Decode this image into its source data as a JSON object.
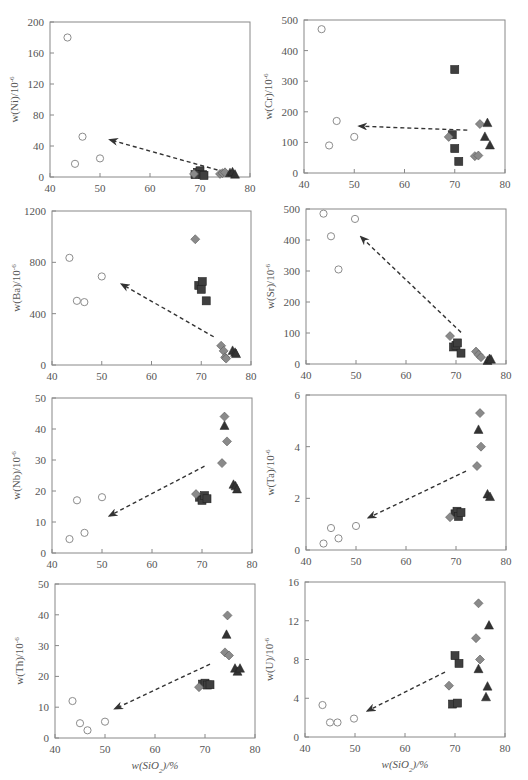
{
  "figure": {
    "x_axis_label": "w(SiO2)/%",
    "x_ticks": [
      40,
      50,
      60,
      70,
      80
    ],
    "xlim": [
      40,
      80
    ],
    "colors": {
      "circle_stroke": "#8c8c8c",
      "circle_fill": "#ffffff",
      "diamond_fill": "#8a8a8a",
      "diamond_stroke": "#5a5a5a",
      "square_fill": "#3f3f3f",
      "triangle_fill": "#333333",
      "axis": "#888888",
      "arrow": "#333333"
    }
  },
  "chart_data": [
    {
      "id": "Ni",
      "type": "scatter",
      "ylabel": "w(Ni)/10^-6",
      "xlabel": "",
      "xlim": [
        40,
        80
      ],
      "ylim": [
        0,
        200
      ],
      "yticks": [
        0,
        40,
        80,
        120,
        160,
        200
      ],
      "series": [
        {
          "name": "circle",
          "points": [
            [
              43.5,
              180
            ],
            [
              45,
              17
            ],
            [
              46.5,
              52
            ],
            [
              50,
              24
            ]
          ]
        },
        {
          "name": "square",
          "points": [
            [
              69.5,
              6
            ],
            [
              70,
              8
            ],
            [
              70.5,
              3
            ],
            [
              69,
              3
            ],
            [
              70.8,
              2
            ]
          ]
        },
        {
          "name": "diamond",
          "points": [
            [
              68.8,
              4
            ],
            [
              74,
              4
            ],
            [
              74.5,
              5
            ],
            [
              75,
              6
            ]
          ]
        },
        {
          "name": "triangle",
          "points": [
            [
              76,
              5
            ],
            [
              76.5,
              6
            ],
            [
              77,
              3
            ]
          ]
        }
      ],
      "arrow": {
        "from": [
          73.5,
          9
        ],
        "to": [
          52,
          48
        ]
      }
    },
    {
      "id": "Cr",
      "type": "scatter",
      "ylabel": "w(Cr)/10^-6",
      "xlabel": "",
      "xlim": [
        40,
        80
      ],
      "ylim": [
        0,
        500
      ],
      "yticks": [
        0,
        100,
        200,
        300,
        400,
        500
      ],
      "series": [
        {
          "name": "circle",
          "points": [
            [
              43.5,
              470
            ],
            [
              45,
              90
            ],
            [
              46.5,
              170
            ],
            [
              50,
              118
            ]
          ]
        },
        {
          "name": "square",
          "points": [
            [
              70,
              338
            ],
            [
              69.5,
              125
            ],
            [
              70,
              80
            ],
            [
              70.8,
              38
            ]
          ]
        },
        {
          "name": "diamond",
          "points": [
            [
              68.8,
              118
            ],
            [
              75,
              160
            ],
            [
              74,
              55
            ],
            [
              74.7,
              57
            ]
          ]
        },
        {
          "name": "triangle",
          "points": [
            [
              76.5,
              163
            ],
            [
              76,
              118
            ],
            [
              77,
              90
            ]
          ]
        }
      ],
      "arrow": {
        "from": [
          72.5,
          140
        ],
        "to": [
          51,
          153
        ]
      }
    },
    {
      "id": "Ba",
      "type": "scatter",
      "ylabel": "w(Ba)/10^-6",
      "xlabel": "",
      "xlim": [
        40,
        80
      ],
      "ylim": [
        0,
        1200
      ],
      "yticks": [
        0,
        400,
        800,
        1200
      ],
      "series": [
        {
          "name": "circle",
          "points": [
            [
              43.5,
              835
            ],
            [
              45,
              500
            ],
            [
              46.5,
              490
            ],
            [
              50,
              690
            ]
          ]
        },
        {
          "name": "square",
          "points": [
            [
              69.5,
              620
            ],
            [
              70.2,
              650
            ],
            [
              70,
              590
            ],
            [
              71,
              500
            ]
          ]
        },
        {
          "name": "diamond",
          "points": [
            [
              68.8,
              980
            ],
            [
              74,
              150
            ],
            [
              74.5,
              110
            ],
            [
              74.8,
              60
            ],
            [
              75,
              50
            ]
          ]
        },
        {
          "name": "triangle",
          "points": [
            [
              76.3,
              110
            ],
            [
              76.8,
              95
            ],
            [
              77,
              85
            ]
          ]
        }
      ],
      "arrow": {
        "from": [
          72.5,
          220
        ],
        "to": [
          54,
          630
        ]
      }
    },
    {
      "id": "Sr",
      "type": "scatter",
      "ylabel": "w(Sr)/10^-6",
      "xlabel": "",
      "xlim": [
        40,
        80
      ],
      "ylim": [
        0,
        500
      ],
      "yticks": [
        0,
        100,
        200,
        300,
        400,
        500
      ],
      "series": [
        {
          "name": "circle",
          "points": [
            [
              43.5,
              485
            ],
            [
              45,
              412
            ],
            [
              46.5,
              305
            ],
            [
              49.8,
              468
            ]
          ]
        },
        {
          "name": "square",
          "points": [
            [
              69.5,
              55
            ],
            [
              70,
              60
            ],
            [
              70.3,
              68
            ],
            [
              71,
              35
            ]
          ]
        },
        {
          "name": "diamond",
          "points": [
            [
              68.8,
              90
            ],
            [
              74,
              40
            ],
            [
              74.5,
              30
            ],
            [
              75,
              22
            ]
          ]
        },
        {
          "name": "triangle",
          "points": [
            [
              76.3,
              10
            ],
            [
              76.7,
              16
            ],
            [
              77,
              14
            ]
          ]
        }
      ],
      "arrow": {
        "from": [
          71,
          102
        ],
        "to": [
          51,
          410
        ]
      }
    },
    {
      "id": "Nb",
      "type": "scatter",
      "ylabel": "w(Nb)/10^-6",
      "xlabel": "",
      "xlim": [
        40,
        80
      ],
      "ylim": [
        0,
        50
      ],
      "yticks": [
        0,
        10,
        20,
        30,
        40,
        50
      ],
      "series": [
        {
          "name": "circle",
          "points": [
            [
              43.5,
              4.5
            ],
            [
              45,
              17
            ],
            [
              46.5,
              6.5
            ],
            [
              50,
              18
            ]
          ]
        },
        {
          "name": "square",
          "points": [
            [
              69.5,
              18
            ],
            [
              70,
              17
            ],
            [
              70.5,
              18.5
            ],
            [
              71,
              17.5
            ]
          ]
        },
        {
          "name": "diamond",
          "points": [
            [
              68.8,
              19
            ],
            [
              74.5,
              44
            ],
            [
              75,
              36
            ],
            [
              74,
              29
            ]
          ]
        },
        {
          "name": "triangle",
          "points": [
            [
              74.5,
              41
            ],
            [
              76.3,
              22
            ],
            [
              76.7,
              21.5
            ],
            [
              77,
              20.5
            ]
          ]
        }
      ],
      "arrow": {
        "from": [
          70.5,
          28
        ],
        "to": [
          51.5,
          12
        ]
      }
    },
    {
      "id": "Ta",
      "type": "scatter",
      "ylabel": "w(Ta)/10^-6",
      "xlabel": "",
      "xlim": [
        40,
        80
      ],
      "ylim": [
        0,
        6
      ],
      "yticks": [
        0,
        2,
        4,
        6
      ],
      "series": [
        {
          "name": "circle",
          "points": [
            [
              43.5,
              0.25
            ],
            [
              45,
              0.85
            ],
            [
              46.5,
              0.45
            ],
            [
              50,
              0.93
            ]
          ]
        },
        {
          "name": "square",
          "points": [
            [
              69.8,
              1.4
            ],
            [
              70.2,
              1.5
            ],
            [
              70.5,
              1.3
            ],
            [
              71,
              1.45
            ]
          ]
        },
        {
          "name": "diamond",
          "points": [
            [
              68.8,
              1.27
            ],
            [
              74.8,
              5.3
            ],
            [
              75,
              4.0
            ],
            [
              74.2,
              3.25
            ]
          ]
        },
        {
          "name": "triangle",
          "points": [
            [
              74.5,
              4.65
            ],
            [
              76.3,
              2.15
            ],
            [
              76.8,
              2.05
            ]
          ]
        }
      ],
      "arrow": {
        "from": [
          72,
          3.05
        ],
        "to": [
          52.5,
          1.25
        ]
      }
    },
    {
      "id": "Th",
      "type": "scatter",
      "ylabel": "w(Th)/10^-6",
      "xlabel": "w(SiO2)/%",
      "xlim": [
        40,
        80
      ],
      "ylim": [
        0,
        50
      ],
      "yticks": [
        0,
        10,
        20,
        30,
        40,
        50
      ],
      "series": [
        {
          "name": "circle",
          "points": [
            [
              43.5,
              12
            ],
            [
              45,
              4.8
            ],
            [
              46.5,
              2.5
            ],
            [
              50,
              5.3
            ]
          ]
        },
        {
          "name": "square",
          "points": [
            [
              69.5,
              17.5
            ],
            [
              70,
              17.8
            ],
            [
              70.5,
              17.2
            ],
            [
              71,
              17.3
            ]
          ]
        },
        {
          "name": "diamond",
          "points": [
            [
              68.8,
              16.5
            ],
            [
              74.5,
              39.8
            ],
            [
              74,
              27.8
            ],
            [
              74.8,
              26.8
            ]
          ]
        },
        {
          "name": "triangle",
          "points": [
            [
              74.3,
              33.5
            ],
            [
              76,
              22.5
            ],
            [
              76.5,
              21.5
            ],
            [
              77,
              22.5
            ]
          ]
        }
      ],
      "arrow": {
        "from": [
          71,
          24
        ],
        "to": [
          52,
          9.5
        ]
      }
    },
    {
      "id": "U",
      "type": "scatter",
      "ylabel": "w(U)/10^-6",
      "xlabel": "w(SiO2)/%",
      "xlim": [
        40,
        80
      ],
      "ylim": [
        0,
        16
      ],
      "yticks": [
        0,
        4,
        8,
        12,
        16
      ],
      "series": [
        {
          "name": "circle",
          "points": [
            [
              43.5,
              3.3
            ],
            [
              45,
              1.5
            ],
            [
              46.5,
              1.5
            ],
            [
              49.8,
              1.9
            ]
          ]
        },
        {
          "name": "square",
          "points": [
            [
              70,
              8.4
            ],
            [
              70.8,
              7.6
            ],
            [
              69.5,
              3.4
            ],
            [
              70.5,
              3.5
            ]
          ]
        },
        {
          "name": "diamond",
          "points": [
            [
              68.8,
              5.3
            ],
            [
              74.7,
              13.8
            ],
            [
              74.2,
              10.2
            ],
            [
              75,
              8
            ]
          ]
        },
        {
          "name": "triangle",
          "points": [
            [
              76.8,
              11.5
            ],
            [
              74.7,
              7
            ],
            [
              76.5,
              5.2
            ],
            [
              76.2,
              4.1
            ]
          ]
        }
      ],
      "arrow": {
        "from": [
          68,
          6.7
        ],
        "to": [
          52.5,
          2.7
        ]
      }
    }
  ],
  "panels_layout": [
    {
      "left": 50,
      "top": 22,
      "width": 200,
      "height": 155
    },
    {
      "left": 304,
      "top": 20,
      "width": 201,
      "height": 153
    },
    {
      "left": 52,
      "top": 211,
      "width": 199,
      "height": 154
    },
    {
      "left": 306,
      "top": 209,
      "width": 200,
      "height": 155
    },
    {
      "left": 52,
      "top": 398,
      "width": 200,
      "height": 155
    },
    {
      "left": 306,
      "top": 395,
      "width": 200,
      "height": 155
    },
    {
      "left": 55,
      "top": 584,
      "width": 200,
      "height": 154
    },
    {
      "left": 305,
      "top": 582,
      "width": 200,
      "height": 155
    }
  ]
}
